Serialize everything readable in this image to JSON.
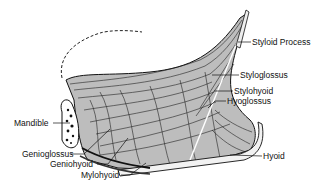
{
  "figure": {
    "labels": {
      "styloid_process": "Styloid Process",
      "styloglossus": "Styloglossus",
      "stylohyoid": "Stylohyoid",
      "hyoglossus": "Hyoglossus",
      "hyoid": "Hyoid",
      "mandible": "Mandible",
      "genioglossus": "Genioglossus",
      "geniohyoid": "Geniohyoid",
      "mylohyoid": "Mylohyoid"
    },
    "colors": {
      "ink": "#111111",
      "background": "#ffffff"
    }
  }
}
